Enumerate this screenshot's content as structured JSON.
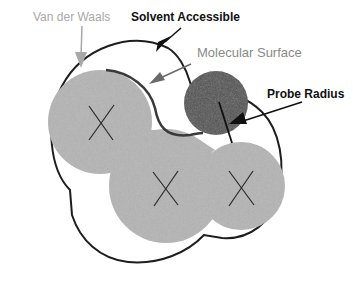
{
  "diagram": {
    "labels": {
      "van_der_waals": "Van der Waals",
      "solvent_accessible": "Solvent Accessible",
      "molecular_surface": "Molecular Surface",
      "probe_radius": "Probe Radius"
    },
    "colors": {
      "atom_fill": "#b4b4b4",
      "probe_fill": "#505050",
      "outline": "#1e1e1e",
      "vdw_arrow": "#a8a8a8",
      "ms_arrow": "#6a6a6a",
      "background": "#ffffff"
    },
    "atoms": [
      {
        "id": "atom-1",
        "cx": 100,
        "cy": 122,
        "r": 52,
        "marker": "X"
      },
      {
        "id": "atom-2",
        "cx": 166,
        "cy": 186,
        "r": 57,
        "marker": "X"
      },
      {
        "id": "atom-3",
        "cx": 241,
        "cy": 186,
        "r": 44,
        "marker": "X"
      }
    ],
    "probe": {
      "cx": 216,
      "cy": 103,
      "r": 32
    }
  }
}
